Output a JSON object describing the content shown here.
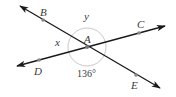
{
  "diagram": {
    "type": "intersecting-lines-angles",
    "center": {
      "label": "A",
      "x": 87,
      "y": 47
    },
    "arc_radius": 19,
    "colors": {
      "line": "#1a1a1a",
      "arc": "#c8c8c8",
      "point": "#888888",
      "text": "#3a3a3a"
    },
    "lines": [
      {
        "name": "BE",
        "from": [
          20,
          6
        ],
        "to": [
          160,
          88
        ],
        "arrows": "both"
      },
      {
        "name": "DC",
        "from": [
          17,
          66
        ],
        "to": [
          165,
          26
        ],
        "arrows": "both"
      }
    ],
    "points": [
      {
        "label": "B",
        "x": 43,
        "y": 20,
        "label_x": 40,
        "label_y": 16
      },
      {
        "label": "C",
        "x": 139,
        "y": 33,
        "label_x": 141,
        "label_y": 27
      },
      {
        "label": "D",
        "x": 39,
        "y": 60,
        "label_x": 35,
        "label_y": 75
      },
      {
        "label": "E",
        "x": 136,
        "y": 75,
        "label_x": 131,
        "label_y": 89
      },
      {
        "label": "A",
        "x": 87,
        "y": 47,
        "label_x": 85,
        "label_y": 42
      }
    ],
    "angle_labels": [
      {
        "text": "x",
        "x": 55,
        "y": 45
      },
      {
        "text": "y",
        "x": 84,
        "y": 20
      },
      {
        "text": "136°",
        "x": 77,
        "y": 76
      }
    ]
  }
}
